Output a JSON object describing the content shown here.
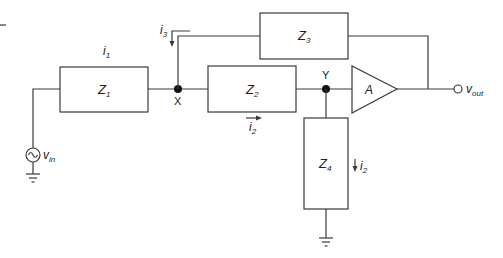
{
  "diagram": {
    "type": "circuit",
    "components": {
      "z1": {
        "label": "Z",
        "sub": "1"
      },
      "z2": {
        "label": "Z",
        "sub": "2"
      },
      "z3": {
        "label": "Z",
        "sub": "3"
      },
      "z4": {
        "label": "Z",
        "sub": "4"
      },
      "amp": {
        "label": "A"
      }
    },
    "nodes": {
      "x": {
        "label": "X"
      },
      "y": {
        "label": "Y"
      }
    },
    "currents": {
      "i1": {
        "label": "i",
        "sub": "1"
      },
      "i2_series": {
        "label": "i",
        "sub": "2"
      },
      "i2_shunt": {
        "label": "i",
        "sub": "2"
      },
      "i3": {
        "label": "i",
        "sub": "3"
      }
    },
    "source": {
      "label": "v",
      "sub": "in"
    },
    "output": {
      "label": "v",
      "sub": "out"
    }
  }
}
